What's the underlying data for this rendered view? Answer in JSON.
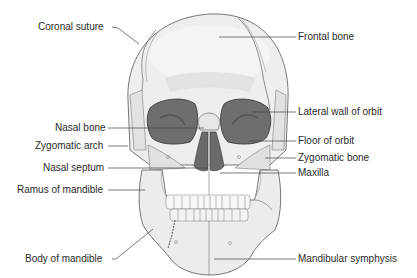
{
  "figure": {
    "colors": {
      "bone": "#eeeeee",
      "bone_shade": "#dcdcdc",
      "bone_dark": "#cfcfcf",
      "cavity": "#6e6e6e",
      "cavity_inner": "#5e5e5e",
      "outline": "#555555",
      "leader": "#444444",
      "text": "#2a2a2a"
    },
    "labels_left": [
      {
        "id": "coronal-suture",
        "text": "Coronal suture"
      },
      {
        "id": "nasal-bone",
        "text": "Nasal bone"
      },
      {
        "id": "zygomatic-arch",
        "text": "Zygomatic arch"
      },
      {
        "id": "nasal-septum",
        "text": "Nasal septum"
      },
      {
        "id": "ramus-of-mandible",
        "text": "Ramus of mandible"
      },
      {
        "id": "body-of-mandible",
        "text": "Body of mandible"
      }
    ],
    "labels_right": [
      {
        "id": "frontal-bone",
        "text": "Frontal bone"
      },
      {
        "id": "lateral-wall-of-orbit",
        "text": "Lateral wall of orbit"
      },
      {
        "id": "floor-of-orbit",
        "text": "Floor of orbit"
      },
      {
        "id": "zygomatic-bone",
        "text": "Zygomatic bone"
      },
      {
        "id": "maxilla",
        "text": "Maxilla"
      },
      {
        "id": "mandibular-symphysis",
        "text": "Mandibular symphysis"
      }
    ]
  }
}
